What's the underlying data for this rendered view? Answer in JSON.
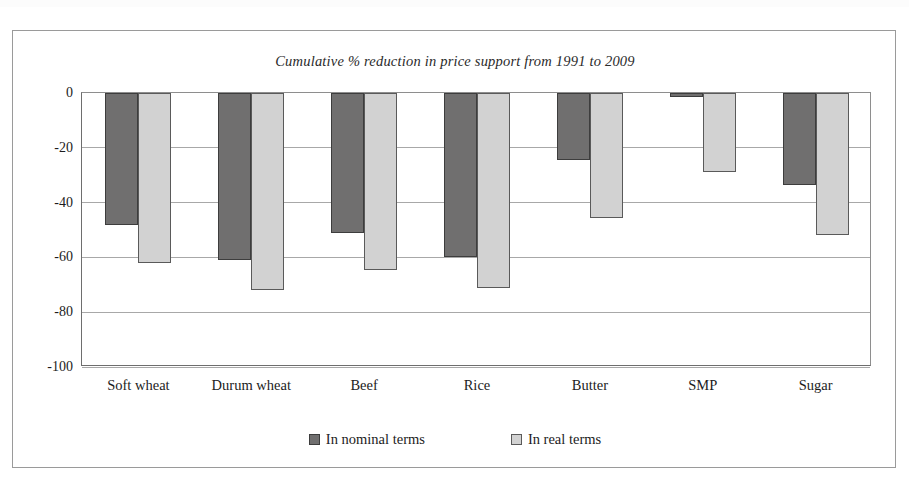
{
  "figure": {
    "title": "Cumulative % reduction in price support from 1991 to 2009"
  },
  "chart_data": {
    "type": "bar",
    "title": "Cumulative % reduction in price support from 1991 to 2009",
    "xlabel": "",
    "ylabel": "",
    "ylim": [
      -100,
      0
    ],
    "yticks": [
      0,
      -20,
      -40,
      -60,
      -80,
      -100
    ],
    "ytick_labels": [
      "0",
      "-20",
      "-40",
      "-60",
      "-80",
      "-100"
    ],
    "grid": true,
    "legend_position": "bottom",
    "categories": [
      "Soft wheat",
      "Durum wheat",
      "Beef",
      "Rice",
      "Butter",
      "SMP",
      "Sugar"
    ],
    "series": [
      {
        "name": "In nominal terms",
        "color": "#706f6f",
        "values": [
          -48,
          -61,
          -51,
          -60,
          -24.5,
          -1.5,
          -33.5
        ]
      },
      {
        "name": "In real terms",
        "color": "#d2d2d2",
        "values": [
          -62,
          -72,
          -64.5,
          -71,
          -45.5,
          -29,
          -52
        ]
      }
    ]
  },
  "legend": {
    "entries": [
      {
        "label": "In nominal terms",
        "swatch": "nominal-swatch"
      },
      {
        "label": "In real terms",
        "swatch": "real-swatch"
      }
    ]
  },
  "colors": {
    "nominal": "#706f6f",
    "real": "#d2d2d2",
    "axis": "#6e6e6e",
    "grid": "#a8a8a8",
    "frame": "#9a9a9a"
  }
}
